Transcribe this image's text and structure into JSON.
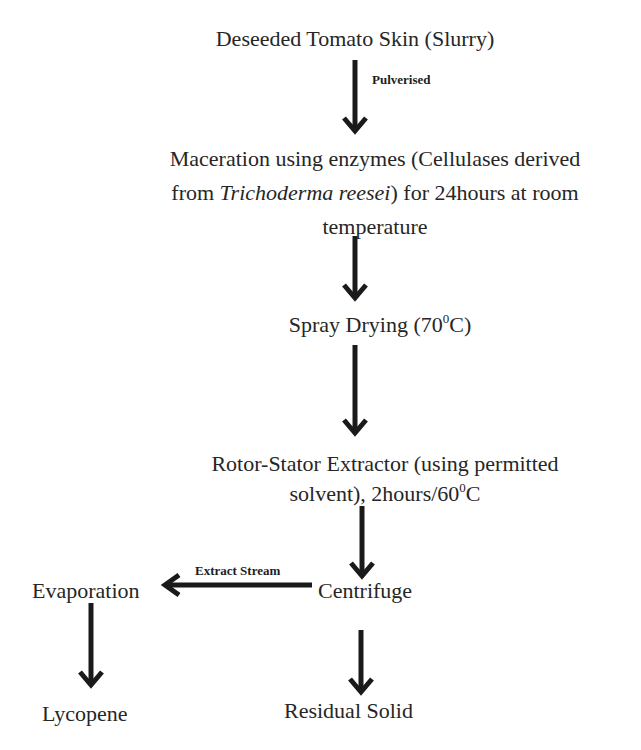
{
  "diagram": {
    "type": "process-flowchart",
    "nodes": {
      "start": {
        "text": "Deseeded Tomato Skin (Slurry)"
      },
      "maceration": {
        "line1": "Maceration using enzymes  (Cellulases derived",
        "line2_prefix": "from ",
        "line2_italic": "Trichoderma reesei",
        "line2_suffix": ")  for 24hours at room",
        "line3": "temperature"
      },
      "spray_drying": {
        "text": "Spray Drying  (70",
        "sup": "0",
        "suffix": "C)"
      },
      "extractor": {
        "line1": "Rotor-Stator Extractor (using permitted",
        "line2": "solvent), 2hours/60",
        "line2_sup": "0",
        "line2_suffix": "C"
      },
      "centrifuge": {
        "text": "Centrifuge"
      },
      "evaporation": {
        "text": "Evaporation"
      },
      "lycopene": {
        "text": "Lycopene"
      },
      "residual_solid": {
        "text": "Residual Solid"
      }
    },
    "edge_labels": {
      "pulverised": "Pulverised",
      "extract_stream": "Extract Stream"
    },
    "edges": [
      {
        "from": "start",
        "to": "maceration",
        "label": "Pulverised"
      },
      {
        "from": "maceration",
        "to": "spray_drying"
      },
      {
        "from": "spray_drying",
        "to": "extractor"
      },
      {
        "from": "extractor",
        "to": "centrifuge"
      },
      {
        "from": "centrifuge",
        "to": "evaporation",
        "label": "Extract Stream"
      },
      {
        "from": "evaporation",
        "to": "lycopene"
      },
      {
        "from": "centrifuge",
        "to": "residual_solid"
      }
    ],
    "colors": {
      "text": "#262626",
      "arrow": "#1a1a1a",
      "background": "#ffffff"
    }
  }
}
